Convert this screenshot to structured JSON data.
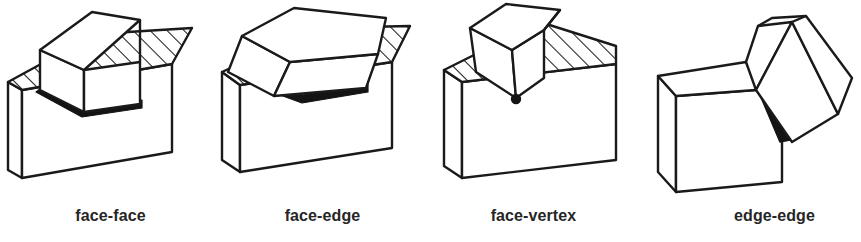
{
  "figure": {
    "background_color": "#ffffff",
    "line_color": "#1a1a1a",
    "fill_color": "#ffffff",
    "hatch_color": "#1a1a1a",
    "contact_color": "#141414",
    "label_color": "#262626"
  },
  "panels": [
    {
      "id": "face-face",
      "label": "face-face",
      "description": "A cube resting flat on the hatched top face of a rectangular block; the contact is a full face, drawn as a thick black band along the cube bottom edges.",
      "contact_kind": "face",
      "base_top_hatched": true,
      "cube_orientation": "axis-aligned upright"
    },
    {
      "id": "face-edge",
      "label": "face-edge",
      "description": "A tilted cube touching the hatched top face of a rectangular block along one of its bottom edges; the contact is a thick black line segment.",
      "contact_kind": "edge",
      "base_top_hatched": true,
      "cube_orientation": "rotated about the viewing-plane axis"
    },
    {
      "id": "face-vertex",
      "label": "face-vertex",
      "description": "A cube balanced on a single corner on the hatched top face of a rectangular block; the contact is a small black dot at the vertex.",
      "contact_kind": "vertex",
      "base_top_hatched": true,
      "cube_orientation": "tipped onto one corner"
    },
    {
      "id": "edge-edge",
      "label": "edge-edge",
      "description": "Two blocks meeting along an edge of each; the unhatched block at the lower left and a tilted cube at the upper right share a thick black contact line.",
      "contact_kind": "edge-edge",
      "base_top_hatched": false,
      "cube_orientation": "rotated and leaning against the block edge"
    }
  ]
}
